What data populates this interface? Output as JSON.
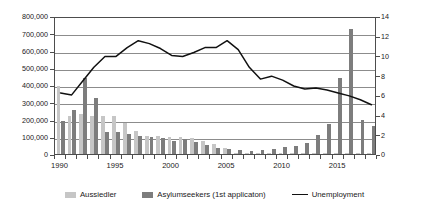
{
  "chart_data": {
    "type": "bar",
    "title": "",
    "subtitle": "",
    "xlabel": "",
    "ylabel": "",
    "grid": true,
    "legend_position": "bottom",
    "x": [
      1990,
      1991,
      1992,
      1993,
      1994,
      1995,
      1996,
      1997,
      1998,
      1999,
      2000,
      2001,
      2002,
      2003,
      2004,
      2005,
      2006,
      2007,
      2008,
      2009,
      2010,
      2011,
      2012,
      2013,
      2014,
      2015,
      2016,
      2017,
      2018
    ],
    "x_tick_labels": [
      "1990",
      "1995",
      "2000",
      "2005",
      "2010",
      "2015"
    ],
    "x_tick_values": [
      1990,
      1995,
      2000,
      2005,
      2010,
      2015
    ],
    "axes": {
      "left": {
        "label": "",
        "min": 0,
        "max": 800000,
        "step": 100000,
        "tick_labels": [
          "0",
          "100,000",
          "200,000",
          "300,000",
          "400,000",
          "500,000",
          "600,000",
          "700,000",
          "800,000"
        ]
      },
      "right": {
        "label": "",
        "min": 0,
        "max": 14,
        "step": 2,
        "tick_labels": [
          "0",
          "2",
          "4",
          "6",
          "8",
          "10",
          "12",
          "14"
        ]
      }
    },
    "series": [
      {
        "name": "Aussiedler",
        "type": "bar",
        "axis": "left",
        "color": "#c6c6c6",
        "values": [
          397000,
          222000,
          230000,
          219000,
          223000,
          218000,
          178000,
          134000,
          103000,
          105000,
          96000,
          98000,
          91000,
          73000,
          59000,
          36000,
          8000,
          6000,
          4000,
          3000,
          2400,
          2200,
          1800,
          2400,
          6000,
          6000,
          7000,
          7000,
          7000
        ]
      },
      {
        "name": "Asylumseekers (1st applicaton)",
        "type": "bar",
        "axis": "left",
        "color": "#7d7d7d",
        "values": [
          193000,
          256000,
          438000,
          323000,
          127000,
          128000,
          116000,
          104000,
          99000,
          95000,
          78000,
          88000,
          71000,
          50000,
          35000,
          29000,
          21000,
          19000,
          22000,
          27000,
          41000,
          45000,
          64000,
          110000,
          173000,
          442000,
          722000,
          198000,
          162000
        ]
      },
      {
        "name": "Unemployment",
        "type": "line",
        "axis": "right",
        "color": "#111111",
        "unit": "%",
        "values": [
          6.4,
          6.2,
          7.6,
          9.0,
          10.1,
          10.1,
          11.0,
          11.7,
          11.4,
          10.9,
          10.2,
          10.1,
          10.5,
          11.0,
          11.0,
          11.7,
          10.8,
          9.0,
          7.8,
          8.1,
          7.7,
          7.1,
          6.8,
          6.9,
          6.7,
          6.4,
          6.1,
          5.7,
          5.2
        ]
      }
    ]
  },
  "legend": {
    "items": [
      {
        "label": "Aussiedler",
        "marker": "square-light-gray"
      },
      {
        "label": "Asylumseekers (1st applicaton)",
        "marker": "square-dark-gray"
      },
      {
        "label": "Unemployment",
        "marker": "line-black"
      }
    ]
  }
}
